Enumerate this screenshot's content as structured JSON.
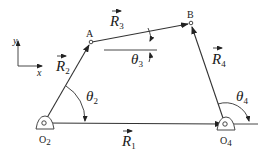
{
  "diagram": {
    "colors": {
      "line": "#333333",
      "text": "#1a1a1a",
      "background": "#ffffff"
    },
    "axes": {
      "x_label": "x",
      "y_label": "y"
    },
    "points": {
      "A": {
        "label": "A"
      },
      "B": {
        "label": "B"
      },
      "O2": {
        "label": "O",
        "sub": "2"
      },
      "O4": {
        "label": "O",
        "sub": "4"
      }
    },
    "vectors": [
      {
        "id": "R1",
        "label": "R",
        "sub": "1",
        "from": "O2",
        "to": "O4"
      },
      {
        "id": "R2",
        "label": "R",
        "sub": "2",
        "from": "O2",
        "to": "A"
      },
      {
        "id": "R3",
        "label": "R",
        "sub": "3",
        "from": "A",
        "to": "B"
      },
      {
        "id": "R4",
        "label": "R",
        "sub": "4",
        "from": "O4",
        "to": "B"
      }
    ],
    "angles": [
      {
        "id": "theta2",
        "label": "θ",
        "sub": "2"
      },
      {
        "id": "theta3",
        "label": "θ",
        "sub": "3"
      },
      {
        "id": "theta4",
        "label": "θ",
        "sub": "4"
      }
    ]
  }
}
